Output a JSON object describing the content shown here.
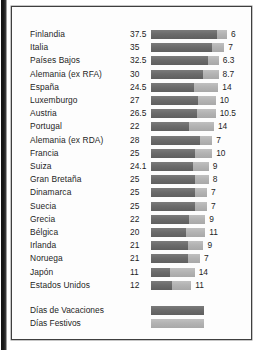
{
  "chart_data": {
    "type": "bar",
    "title": "",
    "subtitle": "",
    "xlabel": "",
    "ylabel": "",
    "orientation": "horizontal",
    "stacked": true,
    "grid": false,
    "legend_position": "bottom-left",
    "xlim": [
      0,
      43.5
    ],
    "categories": [
      "Finlandia",
      "Italia",
      "Países Bajos",
      "Alemania (ex RFA)",
      "España",
      "Luxemburgo",
      "Austria",
      "Portugal",
      "Alemania (ex RDA)",
      "Francia",
      "Suiza",
      "Gran Bretaña",
      "Dinamarca",
      "Suecia",
      "Grecia",
      "Bélgica",
      "Irlanda",
      "Noruega",
      "Japón",
      "Estados Unidos"
    ],
    "series": [
      {
        "name": "Días de Vacaciones",
        "color": "#6e6e6e",
        "values": [
          37.5,
          35,
          32.5,
          30,
          24.5,
          27,
          26.5,
          22,
          28,
          25,
          24.1,
          25,
          25,
          25,
          22,
          20,
          21,
          21,
          11,
          12
        ]
      },
      {
        "name": "Días Festivos",
        "color": "#b6b6b6",
        "values": [
          6,
          7,
          6.3,
          8.7,
          14,
          10,
          10.5,
          14,
          7,
          10,
          9,
          8,
          7,
          7,
          9,
          11,
          9,
          7,
          14,
          11
        ]
      }
    ]
  },
  "rows": [
    {
      "label": "Finlandia",
      "vacation": "37.5",
      "holiday": "6",
      "vacation_n": 37.5,
      "holiday_n": 6
    },
    {
      "label": "Italia",
      "vacation": "35",
      "holiday": "7",
      "vacation_n": 35,
      "holiday_n": 7
    },
    {
      "label": "Países Bajos",
      "vacation": "32.5",
      "holiday": "6.3",
      "vacation_n": 32.5,
      "holiday_n": 6.3
    },
    {
      "label": "Alemania (ex RFA)",
      "vacation": "30",
      "holiday": "8.7",
      "vacation_n": 30,
      "holiday_n": 8.7
    },
    {
      "label": "España",
      "vacation": "24.5",
      "holiday": "14",
      "vacation_n": 24.5,
      "holiday_n": 14
    },
    {
      "label": "Luxemburgo",
      "vacation": "27",
      "holiday": "10",
      "vacation_n": 27,
      "holiday_n": 10
    },
    {
      "label": "Austria",
      "vacation": "26.5",
      "holiday": "10.5",
      "vacation_n": 26.5,
      "holiday_n": 10.5
    },
    {
      "label": "Portugal",
      "vacation": "22",
      "holiday": "14",
      "vacation_n": 22,
      "holiday_n": 14
    },
    {
      "label": "Alemania (ex RDA)",
      "vacation": "28",
      "holiday": "7",
      "vacation_n": 28,
      "holiday_n": 7
    },
    {
      "label": "Francia",
      "vacation": "25",
      "holiday": "10",
      "vacation_n": 25,
      "holiday_n": 10
    },
    {
      "label": "Suiza",
      "vacation": "24.1",
      "holiday": "9",
      "vacation_n": 24.1,
      "holiday_n": 9
    },
    {
      "label": "Gran Bretaña",
      "vacation": "25",
      "holiday": "8",
      "vacation_n": 25,
      "holiday_n": 8
    },
    {
      "label": "Dinamarca",
      "vacation": "25",
      "holiday": "7",
      "vacation_n": 25,
      "holiday_n": 7
    },
    {
      "label": "Suecia",
      "vacation": "25",
      "holiday": "7",
      "vacation_n": 25,
      "holiday_n": 7
    },
    {
      "label": "Grecia",
      "vacation": "22",
      "holiday": "9",
      "vacation_n": 22,
      "holiday_n": 9
    },
    {
      "label": "Bélgica",
      "vacation": "20",
      "holiday": "11",
      "vacation_n": 20,
      "holiday_n": 11
    },
    {
      "label": "Irlanda",
      "vacation": "21",
      "holiday": "9",
      "vacation_n": 21,
      "holiday_n": 9
    },
    {
      "label": "Noruega",
      "vacation": "21",
      "holiday": "7",
      "vacation_n": 21,
      "holiday_n": 7
    },
    {
      "label": "Japón",
      "vacation": "11",
      "holiday": "14",
      "vacation_n": 11,
      "holiday_n": 14
    },
    {
      "label": "Estados Unidos",
      "vacation": "12",
      "holiday": "11",
      "vacation_n": 12,
      "holiday_n": 11
    }
  ],
  "legend": [
    {
      "label": "Días de Vacaciones",
      "swatch": "vac",
      "color": "#6e6e6e"
    },
    {
      "label": "Días Festivos",
      "swatch": "fes",
      "color": "#b6b6b6"
    }
  ],
  "layout": {
    "row_top_start": 21,
    "row_step": 13.2,
    "legend_top_start": 297,
    "legend_step": 13.2,
    "bar_left": 139,
    "px_per_day": 1.747
  }
}
